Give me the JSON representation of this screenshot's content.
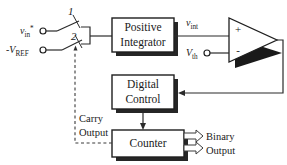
{
  "diagram": {
    "blocks": [
      {
        "id": "integrator",
        "line1": "Positive",
        "line2": "Integrator"
      },
      {
        "id": "digital_control",
        "line1": "Digital",
        "line2": "Control"
      },
      {
        "id": "counter",
        "line1": "Counter",
        "line2": ""
      }
    ],
    "signals": {
      "vin_base": "v",
      "vin_sub": "in",
      "vin_sup": "*",
      "vref_sign": "-",
      "vref_base": "V",
      "vref_sub": "REF",
      "vint_base": "v",
      "vint_sub": "int",
      "vth_base": "V",
      "vth_sub": "th"
    },
    "switch": {
      "position_1": "1",
      "position_2": "2"
    },
    "comparator": {
      "plus": "+",
      "minus": "-"
    },
    "annotations": {
      "carry_line1": "Carry",
      "carry_line2": "Output",
      "binary_line1": "Binary",
      "binary_line2": "Output"
    },
    "colors": {
      "line": "#2b2b2b",
      "box_stroke": "#1f1f1f",
      "shadow": "#262626",
      "background": "#ffffff",
      "text": "#1a1a1a"
    }
  }
}
